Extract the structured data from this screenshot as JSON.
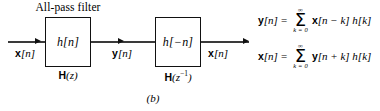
{
  "figure": {
    "subcaption": "(b)",
    "title": "All-pass filter"
  },
  "blocks": [
    {
      "id": "block-1",
      "label": "h[n]",
      "caption_h": "H",
      "caption_arg": "(z)",
      "caption_sup": ""
    },
    {
      "id": "block-2",
      "label": "h[−n]",
      "caption_h": "H",
      "caption_arg": "(z",
      "caption_sup": "−1",
      "caption_close": ")"
    }
  ],
  "signals": [
    {
      "id": "sig-in",
      "bold": "x",
      "rest": "[n]"
    },
    {
      "id": "sig-mid",
      "bold": "y",
      "rest": "[n]"
    },
    {
      "id": "sig-out",
      "bold": "x",
      "rest": "[n]"
    }
  ],
  "arrows": [
    {
      "id": "arrow-in",
      "name": "input-arrowhead"
    },
    {
      "id": "arrow-mid",
      "name": "intermediate-arrowhead"
    },
    {
      "id": "arrow-out",
      "name": "output-arrowhead"
    }
  ],
  "equations": [
    {
      "lhs_bold": "y",
      "lhs_rest": "[n]",
      "equals": "=",
      "sum_upper": "∞",
      "sum_lower": "k = 0",
      "rhs_bold": "x",
      "rhs_rest": "[n − k] h[k]"
    },
    {
      "lhs_bold": "x",
      "lhs_rest": "[n]",
      "equals": "=",
      "sum_upper": "∞",
      "sum_lower": "k = 0",
      "rhs_bold": "y",
      "rhs_rest": "[n + k] h[k]"
    }
  ],
  "colors": {
    "background": "#ffffff",
    "ink": "#000000",
    "wire": "#3a3a3a",
    "block_border": "#111111"
  }
}
